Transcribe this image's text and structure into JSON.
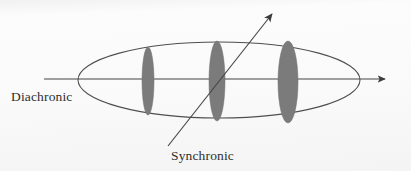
{
  "figure": {
    "background_color": "#fbfbfb",
    "stroke_color": "#4a4a4a",
    "lens_fill_color": "#7b7b7b",
    "label_color": "#2e2e2e",
    "labels": {
      "diachronic": "Diachronic",
      "synchronic": "Synchronic"
    },
    "ellipse": {
      "center_x": 219,
      "center_y": 80,
      "radius_x": 141,
      "radius_y": 38
    },
    "diachronic_axis": {
      "x1": 44,
      "y1": 79,
      "x2": 392,
      "y2": 79,
      "arrow": "right-arrowhead"
    },
    "synchronic_axis": {
      "x1": 168,
      "y1": 146,
      "x2": 276,
      "y2": 9,
      "arrow": "up-right-arrowhead"
    },
    "lenses": [
      {
        "name": "lens-left",
        "cx": 148,
        "cy": 81,
        "rx": 6,
        "ry": 34
      },
      {
        "name": "lens-middle",
        "cx": 217,
        "cy": 81,
        "rx": 8,
        "ry": 40
      },
      {
        "name": "lens-right",
        "cx": 288,
        "cy": 82,
        "rx": 10,
        "ry": 41
      }
    ]
  }
}
